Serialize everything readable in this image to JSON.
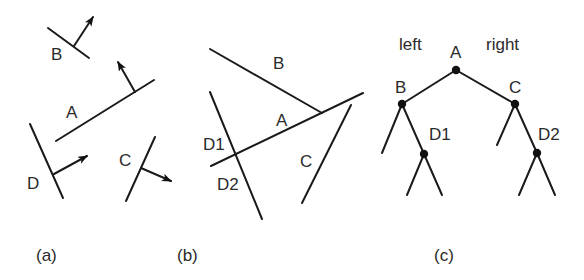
{
  "figure": {
    "panels": [
      {
        "id": "a",
        "caption": "(a)",
        "description": "Four oriented line segments with normal arrows",
        "segments": [
          {
            "label": "B",
            "line": [
              [
                48,
                28
              ],
              [
                89,
                58
              ]
            ],
            "normal": [
              [
                74,
                46
              ],
              [
                93,
                17
              ]
            ]
          },
          {
            "label": "A",
            "line": [
              [
                56,
                141
              ],
              [
                154,
                80
              ]
            ],
            "normal": [
              [
                135,
                92
              ],
              [
                118,
                62
              ]
            ]
          },
          {
            "label": "D",
            "line": [
              [
                30,
                124
              ],
              [
                63,
                198
              ]
            ],
            "normal": [
              [
                54,
                174
              ],
              [
                87,
                156
              ]
            ]
          },
          {
            "label": "C",
            "line": [
              [
                155,
                137
              ],
              [
                126,
                201
              ]
            ],
            "normal": [
              [
                141,
                168
              ],
              [
                171,
                181
              ]
            ]
          }
        ]
      },
      {
        "id": "b",
        "caption": "(b)",
        "description": "Segments arranged with A splitting D into D1 and D2",
        "segments": [
          {
            "label": "B",
            "line": [
              [
                210,
                49
              ],
              [
                322,
                113
              ]
            ]
          },
          {
            "label": "A",
            "line": [
              [
                211,
                166
              ],
              [
                363,
                93
              ]
            ]
          },
          {
            "label": "D1 / D2",
            "line": [
              [
                210,
                92
              ],
              [
                262,
                219
              ]
            ]
          },
          {
            "label": "C",
            "line": [
              [
                351,
                105
              ],
              [
                302,
                203
              ]
            ]
          }
        ],
        "labels": [
          "B",
          "A",
          "D1",
          "D2",
          "C"
        ]
      },
      {
        "id": "c",
        "caption": "(c)",
        "description": "BSP tree",
        "side_labels": {
          "left": "left",
          "right": "right"
        },
        "nodes": [
          {
            "label": "A",
            "x": 456,
            "y": 70
          },
          {
            "label": "B",
            "x": 402,
            "y": 104
          },
          {
            "label": "C",
            "x": 515,
            "y": 104
          },
          {
            "label": "D1",
            "x": 424,
            "y": 154
          },
          {
            "label": "D2",
            "x": 537,
            "y": 153
          }
        ],
        "edges": [
          [
            "A",
            "B"
          ],
          [
            "A",
            "C"
          ],
          [
            "B",
            "D1"
          ],
          [
            "C",
            "D2"
          ]
        ]
      }
    ],
    "labels": {
      "a_B": "B",
      "a_A": "A",
      "a_D": "D",
      "a_C": "C",
      "b_B": "B",
      "b_A": "A",
      "b_D1": "D1",
      "b_D2": "D2",
      "b_C": "C",
      "c_left": "left",
      "c_right": "right",
      "c_A": "A",
      "c_B": "B",
      "c_C": "C",
      "c_D1": "D1",
      "c_D2": "D2"
    },
    "captions": {
      "a": "(a)",
      "b": "(b)",
      "c": "(c)"
    }
  }
}
